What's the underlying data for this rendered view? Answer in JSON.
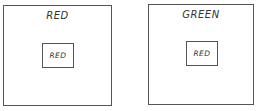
{
  "panels": [
    {
      "outer_label": "RED",
      "inner_label": "RED"
    },
    {
      "outer_label": "GREEN",
      "inner_label": "RED"
    }
  ]
}
